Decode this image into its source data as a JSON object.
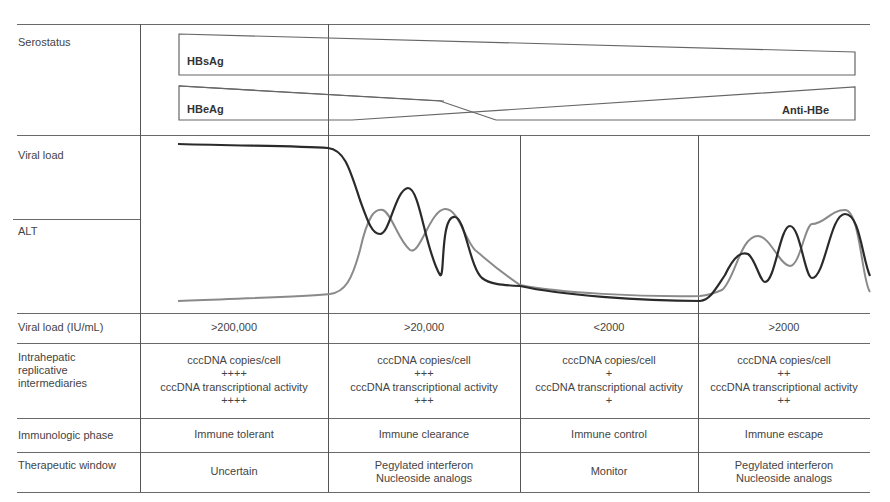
{
  "row_labels": {
    "serostatus": "Serostatus",
    "viral_load": "Viral load",
    "alt": "ALT",
    "viral_load_iu": "Viral load (IU/mL)",
    "intrahepatic": [
      "Intrahepatic",
      "replicative",
      "intermediaries"
    ],
    "immunologic_phase": "Immunologic phase",
    "therapeutic_window": "Therapeutic window"
  },
  "serostatus": {
    "hbsag": "HBsAg",
    "hbeag": "HBeAg",
    "anti_hbe": "Anti-HBe"
  },
  "phases": [
    {
      "viral_load": ">200,000",
      "cccdna_copies_label": "cccDNA copies/cell",
      "cccdna_copies": "++++",
      "cccdna_activity_label": "cccDNA transcriptional activity",
      "cccdna_activity": "++++",
      "immunologic_phase": "Immune tolerant",
      "therapeutic_window": [
        "Uncertain"
      ]
    },
    {
      "viral_load": ">20,000",
      "cccdna_copies_label": "cccDNA copies/cell",
      "cccdna_copies": "+++",
      "cccdna_activity_label": "cccDNA transcriptional activity",
      "cccdna_activity": "+++",
      "immunologic_phase": "Immune clearance",
      "therapeutic_window": [
        "Pegylated interferon",
        "Nucleoside analogs"
      ]
    },
    {
      "viral_load": "<2000",
      "cccdna_copies_label": "cccDNA copies/cell",
      "cccdna_copies": "+",
      "cccdna_activity_label": "cccDNA transcriptional activity",
      "cccdna_activity": "+",
      "immunologic_phase": "Immune control",
      "therapeutic_window": [
        "Monitor"
      ]
    },
    {
      "viral_load": ">2000",
      "cccdna_copies_label": "cccDNA copies/cell",
      "cccdna_copies": "++",
      "cccdna_activity_label": "cccDNA transcriptional activity",
      "cccdna_activity": "++",
      "immunologic_phase": "Immune escape",
      "therapeutic_window": [
        "Pegylated interferon",
        "Nucleoside analogs"
      ]
    }
  ],
  "curve_colors": {
    "viral_load": "#2a2a2a",
    "alt": "#8a8a8a"
  }
}
